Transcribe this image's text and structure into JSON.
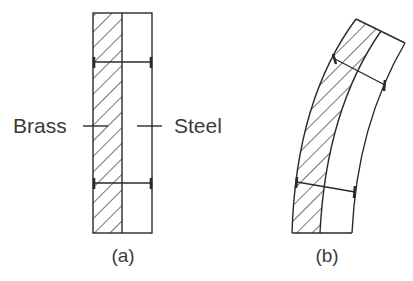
{
  "figure": {
    "colors": {
      "line": "#2a2a2a",
      "text": "#3a3a3a",
      "background": "#ffffff"
    },
    "panel_a": {
      "caption": "(a)",
      "left_material_label": "Brass",
      "right_material_label": "Steel",
      "hatched_material": "Brass"
    },
    "panel_b": {
      "caption": "(b)",
      "hatched_material": "Brass",
      "state": "bent toward steel side"
    }
  }
}
